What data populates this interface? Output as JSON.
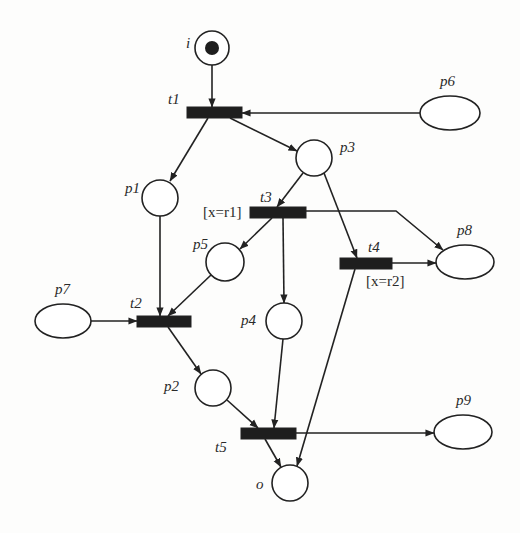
{
  "diagram": {
    "type": "petri-net",
    "colors": {
      "stroke": "#222222",
      "transition_fill": "#1e1e1e",
      "token": "#1e1e1e",
      "background": "#fdfdfc"
    },
    "places": [
      {
        "id": "i",
        "label": "i",
        "shape": "circle",
        "cx": 212,
        "cy": 48,
        "r": 17,
        "tokens": 1,
        "label_x": 186,
        "label_y": 48
      },
      {
        "id": "p1",
        "label": "p1",
        "shape": "circle",
        "cx": 160,
        "cy": 198,
        "r": 18,
        "tokens": 0,
        "label_x": 125,
        "label_y": 193
      },
      {
        "id": "p2",
        "label": "p2",
        "shape": "circle",
        "cx": 213,
        "cy": 388,
        "r": 18,
        "tokens": 0,
        "label_x": 164,
        "label_y": 391
      },
      {
        "id": "p3",
        "label": "p3",
        "shape": "circle",
        "cx": 314,
        "cy": 158,
        "r": 18,
        "tokens": 0,
        "label_x": 340,
        "label_y": 152
      },
      {
        "id": "p4",
        "label": "p4",
        "shape": "circle",
        "cx": 284,
        "cy": 321,
        "r": 18,
        "tokens": 0,
        "label_x": 241,
        "label_y": 325
      },
      {
        "id": "p5",
        "label": "p5",
        "shape": "circle",
        "cx": 225,
        "cy": 262,
        "r": 19,
        "tokens": 0,
        "label_x": 193,
        "label_y": 249
      },
      {
        "id": "p6",
        "label": "p6",
        "shape": "ellipse",
        "cx": 450,
        "cy": 113,
        "rx": 30,
        "ry": 17,
        "tokens": 0,
        "label_x": 440,
        "label_y": 86
      },
      {
        "id": "p7",
        "label": "p7",
        "shape": "ellipse",
        "cx": 63,
        "cy": 321,
        "rx": 28,
        "ry": 17,
        "tokens": 0,
        "label_x": 55,
        "label_y": 294
      },
      {
        "id": "p8",
        "label": "p8",
        "shape": "ellipse",
        "cx": 465,
        "cy": 262,
        "rx": 29,
        "ry": 17,
        "tokens": 0,
        "label_x": 457,
        "label_y": 235
      },
      {
        "id": "p9",
        "label": "p9",
        "shape": "ellipse",
        "cx": 463,
        "cy": 432,
        "rx": 29,
        "ry": 17,
        "tokens": 0,
        "label_x": 456,
        "label_y": 405
      },
      {
        "id": "o",
        "label": "o",
        "shape": "circle",
        "cx": 290,
        "cy": 483,
        "r": 18,
        "tokens": 0,
        "label_x": 256,
        "label_y": 489
      }
    ],
    "transitions": [
      {
        "id": "t1",
        "label": "t1",
        "x": 187,
        "y": 107,
        "w": 55,
        "h": 11,
        "label_x": 168,
        "label_y": 104,
        "guard": ""
      },
      {
        "id": "t2",
        "label": "t2",
        "x": 137,
        "y": 316,
        "w": 54,
        "h": 11,
        "label_x": 130,
        "label_y": 308,
        "guard": ""
      },
      {
        "id": "t3",
        "label": "t3",
        "x": 250,
        "y": 207,
        "w": 56,
        "h": 11,
        "label_x": 260,
        "label_y": 202,
        "guard": "[x=r1]",
        "guard_x": 203,
        "guard_y": 217
      },
      {
        "id": "t4",
        "label": "t4",
        "x": 340,
        "y": 258,
        "w": 52,
        "h": 11,
        "label_x": 368,
        "label_y": 252,
        "guard": "[x=r2]",
        "guard_x": 366,
        "guard_y": 286
      },
      {
        "id": "t5",
        "label": "t5",
        "x": 241,
        "y": 428,
        "w": 55,
        "h": 11,
        "label_x": 215,
        "label_y": 452,
        "guard": ""
      }
    ],
    "arcs": [
      {
        "from": "i",
        "to": "t1",
        "points": [
          [
            212,
            65
          ],
          [
            212,
            107
          ]
        ]
      },
      {
        "from": "p6",
        "to": "t1",
        "points": [
          [
            420,
            113
          ],
          [
            242,
            113
          ]
        ]
      },
      {
        "from": "t1",
        "to": "p1",
        "points": [
          [
            208,
            118
          ],
          [
            170,
            181
          ]
        ]
      },
      {
        "from": "t1",
        "to": "p3",
        "points": [
          [
            230,
            118
          ],
          [
            297,
            151
          ]
        ]
      },
      {
        "from": "p3",
        "to": "t3",
        "points": [
          [
            303,
            173
          ],
          [
            277,
            207
          ]
        ]
      },
      {
        "from": "p3",
        "to": "t4",
        "points": [
          [
            324,
            173
          ],
          [
            357,
            258
          ]
        ]
      },
      {
        "from": "t3",
        "to": "p8",
        "points": [
          [
            306,
            211
          ],
          [
            396,
            211
          ],
          [
            443,
            250
          ]
        ]
      },
      {
        "from": "t3",
        "to": "p5",
        "points": [
          [
            272,
            218
          ],
          [
            240,
            249
          ]
        ]
      },
      {
        "from": "t3",
        "to": "p4",
        "points": [
          [
            283,
            218
          ],
          [
            284,
            303
          ]
        ]
      },
      {
        "from": "t4",
        "to": "p8",
        "points": [
          [
            392,
            263
          ],
          [
            436,
            263
          ]
        ]
      },
      {
        "from": "t4",
        "to": "o",
        "points": [
          [
            355,
            269
          ],
          [
            297,
            466
          ]
        ]
      },
      {
        "from": "p1",
        "to": "t2",
        "points": [
          [
            160,
            216
          ],
          [
            160,
            316
          ]
        ]
      },
      {
        "from": "p5",
        "to": "t2",
        "points": [
          [
            211,
            275
          ],
          [
            168,
            316
          ]
        ]
      },
      {
        "from": "p7",
        "to": "t2",
        "points": [
          [
            91,
            321
          ],
          [
            137,
            321
          ]
        ]
      },
      {
        "from": "t2",
        "to": "p2",
        "points": [
          [
            168,
            327
          ],
          [
            201,
            374
          ]
        ]
      },
      {
        "from": "p2",
        "to": "t5",
        "points": [
          [
            227,
            400
          ],
          [
            258,
            428
          ]
        ]
      },
      {
        "from": "p4",
        "to": "t5",
        "points": [
          [
            283,
            339
          ],
          [
            274,
            428
          ]
        ]
      },
      {
        "from": "t5",
        "to": "o",
        "points": [
          [
            265,
            439
          ],
          [
            281,
            467
          ]
        ]
      },
      {
        "from": "t5",
        "to": "p9",
        "points": [
          [
            296,
            433
          ],
          [
            434,
            433
          ]
        ]
      }
    ]
  }
}
